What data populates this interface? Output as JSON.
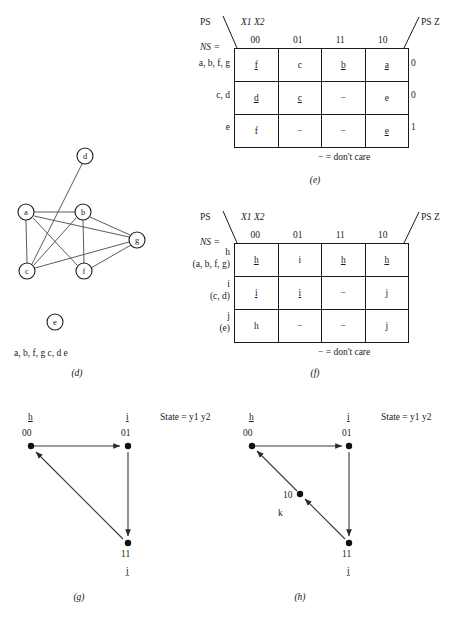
{
  "figure_e": {
    "caption": "(e)",
    "ps_label": "PS",
    "ps_z_label": "PS Z",
    "input_label": "X1 X2",
    "ns_label": "NS =",
    "dont_care_note": "−  =  don't care",
    "column_headers": [
      "00",
      "01",
      "11",
      "10"
    ],
    "row_labels": [
      "a, b, f, g",
      "c, d",
      "e"
    ],
    "rows": [
      {
        "cells": [
          {
            "text": "f",
            "underline": true
          },
          {
            "text": "c",
            "underline": false
          },
          {
            "text": "b",
            "underline": true
          },
          {
            "text": "a",
            "underline": true
          }
        ],
        "output": "0"
      },
      {
        "cells": [
          {
            "text": "d",
            "underline": true
          },
          {
            "text": "c",
            "underline": true
          },
          {
            "text": "−",
            "underline": false
          },
          {
            "text": "e",
            "underline": false
          }
        ],
        "output": "0"
      },
      {
        "cells": [
          {
            "text": "f",
            "underline": false
          },
          {
            "text": "−",
            "underline": false
          },
          {
            "text": "−",
            "underline": false
          },
          {
            "text": "e",
            "underline": true
          }
        ],
        "output": "1"
      }
    ]
  },
  "figure_f": {
    "caption": "(f)",
    "ps_label": "PS",
    "ps_z_label": "PS Z",
    "input_label": "X1 X2",
    "ns_label": "NS =",
    "dont_care_note": "−  =  don't care",
    "column_headers": [
      "00",
      "01",
      "11",
      "10"
    ],
    "row_labels": [
      {
        "primary": "h",
        "secondary": "(a, b, f, g)"
      },
      {
        "primary": "i",
        "secondary": "(c, d)"
      },
      {
        "primary": "j",
        "secondary": "(e)"
      }
    ],
    "rows": [
      {
        "cells": [
          {
            "text": "h",
            "underline": true
          },
          {
            "text": "i",
            "underline": false
          },
          {
            "text": "h",
            "underline": true
          },
          {
            "text": "h",
            "underline": true
          }
        ]
      },
      {
        "cells": [
          {
            "text": "i",
            "underline": true
          },
          {
            "text": "i",
            "underline": true
          },
          {
            "text": "−",
            "underline": false
          },
          {
            "text": "j",
            "underline": false
          }
        ]
      },
      {
        "cells": [
          {
            "text": "h",
            "underline": false
          },
          {
            "text": "−",
            "underline": false
          },
          {
            "text": "−",
            "underline": false
          },
          {
            "text": "j",
            "underline": true
          }
        ]
      }
    ]
  },
  "figure_d": {
    "caption": "(d)",
    "nodes": [
      {
        "id": "d",
        "label": "d",
        "cx": 85,
        "cy": 156
      },
      {
        "id": "a",
        "label": "a",
        "cx": 26,
        "cy": 212
      },
      {
        "id": "b",
        "label": "b",
        "cx": 83,
        "cy": 212
      },
      {
        "id": "c",
        "label": "c",
        "cx": 27,
        "cy": 271
      },
      {
        "id": "f",
        "label": "f",
        "cx": 84,
        "cy": 271
      },
      {
        "id": "g",
        "label": "g",
        "cx": 137,
        "cy": 240
      },
      {
        "id": "e_isolated",
        "label": "e",
        "cx": 55,
        "cy": 322
      }
    ],
    "edges": [
      [
        "a",
        "b"
      ],
      [
        "a",
        "c"
      ],
      [
        "a",
        "f"
      ],
      [
        "a",
        "g"
      ],
      [
        "b",
        "c"
      ],
      [
        "b",
        "f"
      ],
      [
        "b",
        "g"
      ],
      [
        "c",
        "d"
      ],
      [
        "c",
        "g"
      ],
      [
        "f",
        "g"
      ]
    ],
    "partition_text": "a, b, f, g    c, d    e"
  },
  "figure_g": {
    "caption": "(g)",
    "state_legend": "State  =  y1 y2",
    "nodes": [
      {
        "name": "h",
        "code": "00",
        "x": 31,
        "y": 446,
        "name_pos": "top",
        "underline": true
      },
      {
        "name": "i",
        "code": "01",
        "x": 128,
        "y": 446,
        "name_pos": "top",
        "underline": true
      },
      {
        "name": "j",
        "code": "11",
        "x": 128,
        "y": 543,
        "name_pos": "bottom",
        "underline": true
      }
    ],
    "transitions": [
      {
        "from": "00",
        "to": "01"
      },
      {
        "from": "01",
        "to": "11"
      },
      {
        "from": "11",
        "to": "00"
      }
    ]
  },
  "figure_h": {
    "caption": "(h)",
    "state_legend": "State  =  y1 y2",
    "nodes": [
      {
        "name": "h",
        "code": "00",
        "x": 252,
        "y": 446,
        "name_pos": "top",
        "underline": true
      },
      {
        "name": "i",
        "code": "01",
        "x": 349,
        "y": 446,
        "name_pos": "top",
        "underline": true
      },
      {
        "name": "j",
        "code": "11",
        "x": 349,
        "y": 543,
        "name_pos": "bottom",
        "underline": true
      },
      {
        "name": "k",
        "code": "10",
        "x": 300,
        "y": 495,
        "name_pos": "left",
        "underline": false
      }
    ],
    "transitions": [
      {
        "from": "00",
        "to": "01"
      },
      {
        "from": "01",
        "to": "11"
      },
      {
        "from": "11",
        "to": "10"
      },
      {
        "from": "10",
        "to": "00"
      }
    ]
  }
}
